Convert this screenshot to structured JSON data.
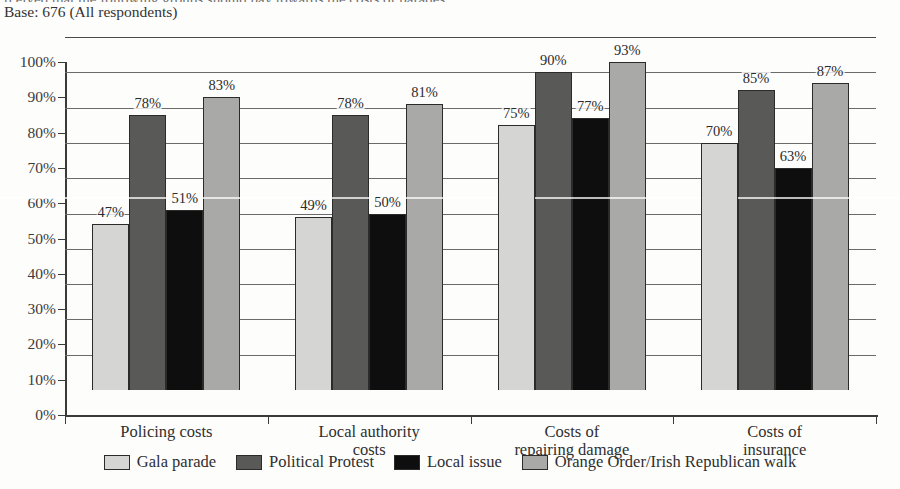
{
  "document": {
    "title_cut_off": "rceived that the following groups should pay towards the costs of parades",
    "base_note": "Base: 676 (All respondents)"
  },
  "chart_data": {
    "type": "bar",
    "title": "",
    "xlabel": "",
    "ylabel": "",
    "ylim": [
      0,
      100
    ],
    "ytick_values": [
      0,
      10,
      20,
      30,
      40,
      50,
      60,
      70,
      80,
      90,
      100
    ],
    "ytick_labels": [
      "0%",
      "10%",
      "20%",
      "30%",
      "40%",
      "50%",
      "60%",
      "70%",
      "80%",
      "90%",
      "100%"
    ],
    "grid": true,
    "legend_position": "bottom",
    "value_suffix": "%",
    "categories": [
      "Policing costs",
      "Local authority costs",
      "Costs of repairing damage",
      "Costs of insurance"
    ],
    "category_lines": [
      [
        "Policing costs"
      ],
      [
        "Local authority",
        "costs"
      ],
      [
        "Costs of",
        "repairing damage"
      ],
      [
        "Costs of",
        "insurance"
      ]
    ],
    "series": [
      {
        "name": "Gala parade",
        "color": "#d5d5d3",
        "values": [
          47,
          49,
          75,
          70
        ],
        "labels": [
          "47%",
          "49%",
          "75%",
          "70%"
        ]
      },
      {
        "name": "Political Protest",
        "color": "#595957",
        "values": [
          78,
          78,
          90,
          85
        ],
        "labels": [
          "78%",
          "78%",
          "90%",
          "85%"
        ]
      },
      {
        "name": "Local issue",
        "color": "#0e0e0e",
        "values": [
          51,
          50,
          77,
          63
        ],
        "labels": [
          "51%",
          "50%",
          "77%",
          "63%"
        ]
      },
      {
        "name": "Orange Order/Irish Republican walk",
        "color": "#a9a9a7",
        "values": [
          83,
          81,
          93,
          87
        ],
        "labels": [
          "83%",
          "81%",
          "93%",
          "87%"
        ]
      }
    ]
  }
}
